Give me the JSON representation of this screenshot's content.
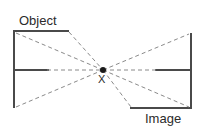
{
  "diagram": {
    "type": "optics-ray-diagram",
    "title_visible": false,
    "background_color": "#ffffff",
    "stroke_color": "#4a4a4a",
    "dash_color": "#8a8a8a",
    "text_color": "#2b2b2b",
    "labels": {
      "object": "Object",
      "image": "Image",
      "center_point": "X"
    },
    "geometry": {
      "canvas": {
        "width": 205,
        "height": 131
      },
      "center_point": {
        "x": 103,
        "y": 70,
        "radius": 3
      },
      "object_side": {
        "vertical_line": {
          "x": 14,
          "y1": 31,
          "y2": 108
        },
        "top_horizontal": {
          "y": 31,
          "x1": 14,
          "x2": 69
        },
        "axis_horizontal_solid": {
          "y": 70,
          "x1": 14,
          "x2": 49
        }
      },
      "image_side": {
        "vertical_line": {
          "x": 191,
          "y1": 33,
          "y2": 109
        },
        "bottom_horizontal": {
          "y": 108,
          "x1": 130,
          "x2": 191
        },
        "axis_horizontal_solid": {
          "y": 70,
          "x1": 155,
          "x2": 191
        }
      },
      "rays": [
        {
          "name": "ray-object-top-left-to-x",
          "x1": 16,
          "y1": 33,
          "x2": 103,
          "y2": 70
        },
        {
          "name": "ray-object-top-right-to-x",
          "x1": 69,
          "y1": 32,
          "x2": 103,
          "y2": 70
        },
        {
          "name": "ray-object-bottom-to-x",
          "x1": 16,
          "y1": 107,
          "x2": 103,
          "y2": 70
        },
        {
          "name": "ray-axis-object-to-x",
          "x1": 49,
          "y1": 70,
          "x2": 103,
          "y2": 70
        },
        {
          "name": "ray-x-to-image-top",
          "x1": 103,
          "y1": 70,
          "x2": 189,
          "y2": 34
        },
        {
          "name": "ray-x-to-image-bottom-left",
          "x1": 103,
          "y1": 70,
          "x2": 131,
          "y2": 107
        },
        {
          "name": "ray-x-to-image-bottom",
          "x1": 103,
          "y1": 70,
          "x2": 189,
          "y2": 107
        },
        {
          "name": "ray-axis-x-to-image",
          "x1": 103,
          "y1": 70,
          "x2": 155,
          "y2": 70
        }
      ],
      "dash_pattern": "4 3",
      "stroke_width_solid": 2,
      "stroke_width_dash": 1
    }
  }
}
